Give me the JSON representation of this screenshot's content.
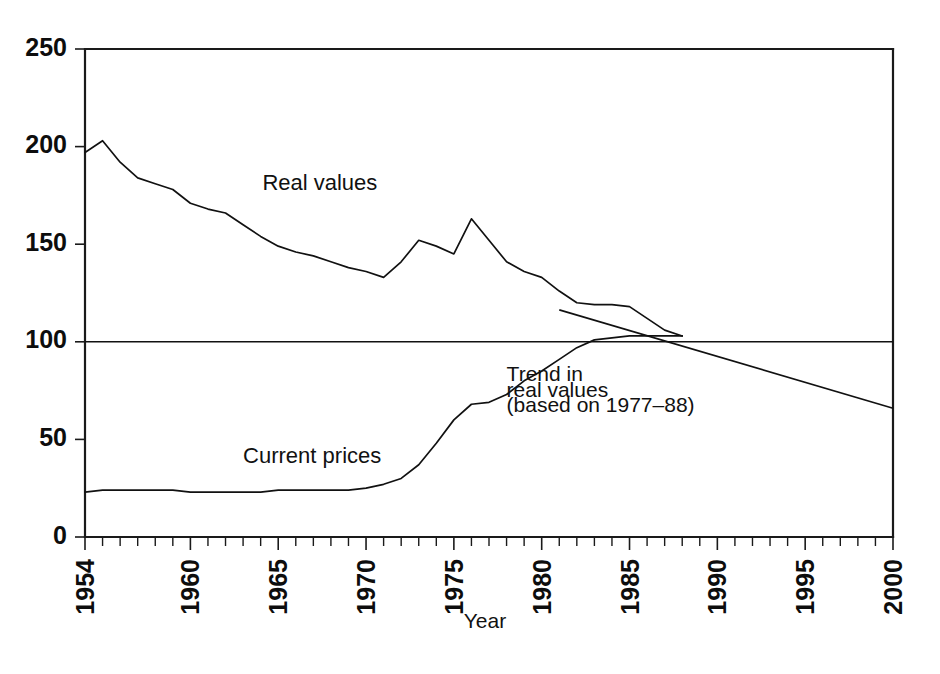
{
  "chart_data": {
    "type": "line",
    "title": "",
    "subtitle": "",
    "xlabel": "Year",
    "ylabel": "",
    "xlim": [
      1954,
      2000
    ],
    "ylim": [
      0,
      250
    ],
    "grid": false,
    "legend_position": "inline-annotations",
    "y_ticks": [
      0,
      50,
      100,
      150,
      200,
      250
    ],
    "y_tick_labels": [
      "0",
      "50",
      "100",
      "150",
      "200",
      "250"
    ],
    "x_ticks": [
      1954,
      1960,
      1965,
      1970,
      1975,
      1980,
      1985,
      1990,
      1995,
      2000
    ],
    "x_tick_labels": [
      "1954",
      "1960",
      "1965",
      "1970",
      "1975",
      "1980",
      "1985",
      "1990",
      "1995",
      "2000"
    ],
    "x_minor_tick_interval": 1,
    "reference_lines": [
      {
        "name": "index-100-line",
        "axis": "y",
        "value": 100
      }
    ],
    "series": [
      {
        "name": "Real values",
        "label": "Real values",
        "label_x": 1964.1,
        "label_y": 178,
        "x": [
          1954,
          1955,
          1956,
          1957,
          1958,
          1959,
          1960,
          1961,
          1962,
          1963,
          1964,
          1965,
          1966,
          1967,
          1968,
          1969,
          1970,
          1971,
          1972,
          1973,
          1974,
          1975,
          1976,
          1977,
          1978,
          1979,
          1980,
          1981,
          1982,
          1983,
          1984,
          1985,
          1986,
          1987,
          1988
        ],
        "values": [
          197,
          203,
          192,
          184,
          181,
          178,
          171,
          168,
          166,
          160,
          154,
          149,
          146,
          144,
          141,
          138,
          136,
          133,
          141,
          152,
          149,
          145,
          163,
          152,
          141,
          136,
          133,
          126,
          120,
          119,
          119,
          118,
          112,
          106,
          103
        ]
      },
      {
        "name": "Current prices",
        "label": "Current prices",
        "label_x": 1963.0,
        "label_y": 38,
        "x": [
          1954,
          1955,
          1956,
          1957,
          1958,
          1959,
          1960,
          1961,
          1962,
          1963,
          1964,
          1965,
          1966,
          1967,
          1968,
          1969,
          1970,
          1971,
          1972,
          1973,
          1974,
          1975,
          1976,
          1977,
          1978,
          1979,
          1980,
          1981,
          1982,
          1983,
          1984,
          1985,
          1986,
          1987,
          1988
        ],
        "values": [
          23,
          24,
          24,
          24,
          24,
          24,
          23,
          23,
          23,
          23,
          23,
          24,
          24,
          24,
          24,
          24,
          25,
          27,
          30,
          37,
          48,
          60,
          68,
          69,
          73,
          80,
          85,
          91,
          97,
          101,
          102,
          103,
          103,
          103,
          103
        ]
      },
      {
        "name": "Trend in real values",
        "label": "Trend in\nreal values\n(based on 1977–88)",
        "label_lines": [
          "Trend in",
          "real values",
          "(based on 1977–88)"
        ],
        "label_x": 1978.0,
        "label_y": 80,
        "x": [
          1983.4,
          2000
        ],
        "values": [
          110,
          66
        ],
        "note": "Fitted linear trend based on 1977–88, extrapolated to 2000"
      }
    ],
    "annotations": [
      {
        "name": "real-values-label",
        "text": "Real values"
      },
      {
        "name": "current-prices-label",
        "text": "Current prices"
      },
      {
        "name": "trend-label-line-1",
        "text": "Trend in"
      },
      {
        "name": "trend-label-line-2",
        "text": "real values"
      },
      {
        "name": "trend-label-line-3",
        "text": "(based on 1977–88)"
      }
    ]
  },
  "axes": {
    "x_title": "Year",
    "y_tick_0": "0",
    "y_tick_50": "50",
    "y_tick_100": "100",
    "y_tick_150": "150",
    "y_tick_200": "200",
    "y_tick_250": "250",
    "x_tick_1954": "1954",
    "x_tick_1960": "1960",
    "x_tick_1965": "1965",
    "x_tick_1970": "1970",
    "x_tick_1975": "1975",
    "x_tick_1980": "1980",
    "x_tick_1985": "1985",
    "x_tick_1990": "1990",
    "x_tick_1995": "1995",
    "x_tick_2000": "2000"
  },
  "labels": {
    "real_values": "Real values",
    "current_prices": "Current prices",
    "trend_line_1": "Trend in",
    "trend_line_2": "real values",
    "trend_line_3": "(based on 1977–88)"
  },
  "colors": {
    "background": "#ffffff",
    "ink": "#111111",
    "axis": "#1a1a1a"
  }
}
